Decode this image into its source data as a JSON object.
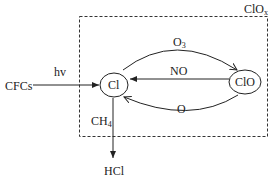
{
  "diagram": {
    "region_label": {
      "main": "ClO",
      "sub": "x"
    },
    "nodes": {
      "cl": "Cl",
      "clo": "ClO",
      "cfcs": "CFCs",
      "hcl": "HCl"
    },
    "edges": {
      "cfcs_to_cl": "hv",
      "cl_to_clo": {
        "main": "O",
        "sub": "3"
      },
      "clo_to_cl_straight": "NO",
      "clo_to_cl_lower": "O",
      "cl_to_hcl": {
        "main": "CH",
        "sub": "4"
      }
    }
  }
}
